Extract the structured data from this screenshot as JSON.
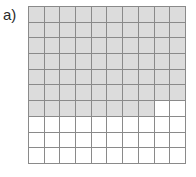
{
  "figure": {
    "panel_label": "a)",
    "caption": ""
  },
  "chart_data": {
    "type": "heatmap",
    "title": "a)",
    "subtitle": "",
    "xlabel": "",
    "ylabel": "",
    "rows": 10,
    "cols": 10,
    "grid_on": true,
    "legend_position": "none",
    "xticklabels": [],
    "yticklabels": [],
    "colors": {
      "filled": "#dcdcdc",
      "empty": "#ffffff",
      "gridline": "#8a8a8a",
      "label": "#2b2b2b"
    },
    "value_legend": {
      "1": "filled",
      "0": "empty"
    },
    "filled_count": 68,
    "empty_count": 32,
    "values": [
      [
        1,
        1,
        1,
        1,
        1,
        1,
        1,
        1,
        1,
        1
      ],
      [
        1,
        1,
        1,
        1,
        1,
        1,
        1,
        1,
        1,
        1
      ],
      [
        1,
        1,
        1,
        1,
        1,
        1,
        1,
        1,
        1,
        1
      ],
      [
        1,
        1,
        1,
        1,
        1,
        1,
        1,
        1,
        1,
        1
      ],
      [
        1,
        1,
        1,
        1,
        1,
        1,
        1,
        1,
        1,
        1
      ],
      [
        1,
        1,
        1,
        1,
        1,
        1,
        1,
        1,
        1,
        1
      ],
      [
        1,
        1,
        1,
        1,
        1,
        1,
        1,
        1,
        0,
        0
      ],
      [
        0,
        0,
        0,
        0,
        0,
        0,
        0,
        0,
        0,
        0
      ],
      [
        0,
        0,
        0,
        0,
        0,
        0,
        0,
        0,
        0,
        0
      ],
      [
        0,
        0,
        0,
        0,
        0,
        0,
        0,
        0,
        0,
        0
      ]
    ]
  }
}
